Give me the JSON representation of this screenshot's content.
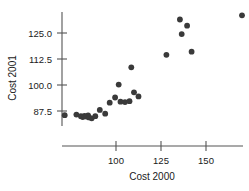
{
  "chart_data": {
    "type": "scatter",
    "title": "",
    "xlabel": "Cost 2000",
    "ylabel": "Cost 2001",
    "xlim": [
      68,
      178
    ],
    "ylim": [
      80,
      136
    ],
    "xticks": [
      100,
      125,
      150
    ],
    "xtick_labels": [
      "100",
      "125",
      "150"
    ],
    "yticks": [
      87.5,
      100.0,
      112.5,
      125.0
    ],
    "ytick_labels": [
      "87.5",
      "100.0",
      "112.5",
      "125.0"
    ],
    "grid": false,
    "legend": null,
    "marker": "filled-circle",
    "marker_color": "#3a3a3a",
    "points": [
      {
        "x": 71.5,
        "y": 85.5
      },
      {
        "x": 78.0,
        "y": 85.8
      },
      {
        "x": 80.5,
        "y": 85.0
      },
      {
        "x": 81.5,
        "y": 84.6
      },
      {
        "x": 82.5,
        "y": 85.2
      },
      {
        "x": 83.5,
        "y": 84.8
      },
      {
        "x": 84.5,
        "y": 85.4
      },
      {
        "x": 85.0,
        "y": 84.4
      },
      {
        "x": 86.5,
        "y": 84.0
      },
      {
        "x": 88.5,
        "y": 85.0
      },
      {
        "x": 91.0,
        "y": 88.0
      },
      {
        "x": 94.0,
        "y": 86.2
      },
      {
        "x": 96.5,
        "y": 91.5
      },
      {
        "x": 99.5,
        "y": 94.0
      },
      {
        "x": 101.5,
        "y": 100.2
      },
      {
        "x": 102.5,
        "y": 92.0
      },
      {
        "x": 105.0,
        "y": 91.8
      },
      {
        "x": 107.5,
        "y": 92.2
      },
      {
        "x": 108.5,
        "y": 108.5
      },
      {
        "x": 110.0,
        "y": 96.5
      },
      {
        "x": 112.5,
        "y": 94.5
      },
      {
        "x": 128.0,
        "y": 114.5
      },
      {
        "x": 135.5,
        "y": 131.5
      },
      {
        "x": 136.5,
        "y": 124.5
      },
      {
        "x": 139.5,
        "y": 128.5
      },
      {
        "x": 142.0,
        "y": 116.0
      },
      {
        "x": 170.0,
        "y": 133.5
      }
    ]
  },
  "axis_titles": {
    "x": "Cost 2000",
    "y": "Cost 2001"
  }
}
